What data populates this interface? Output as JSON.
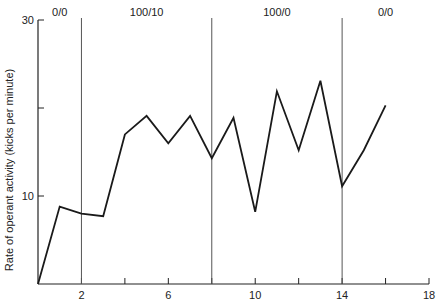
{
  "chart_data": {
    "type": "line",
    "title": "",
    "xlabel": "",
    "ylabel": "Rate of operant activity (kicks per minute)",
    "xlim": [
      0,
      18
    ],
    "ylim": [
      0,
      30
    ],
    "x_ticks": [
      2,
      4,
      6,
      8,
      10,
      12,
      14,
      16,
      18
    ],
    "x_tick_labels": [
      "2",
      "",
      "6",
      "",
      "10",
      "",
      "14",
      "",
      "18"
    ],
    "y_ticks": [
      10,
      20,
      30
    ],
    "y_tick_labels": [
      "10",
      "",
      "30"
    ],
    "grid": false,
    "legend": null,
    "phase_dividers": [
      2,
      8,
      14
    ],
    "phases": [
      {
        "label": "0/0",
        "start": 0,
        "end": 2
      },
      {
        "label": "100/10",
        "start": 2,
        "end": 8
      },
      {
        "label": "100/0",
        "start": 8,
        "end": 14
      },
      {
        "label": "0/0",
        "start": 14,
        "end": 18
      }
    ],
    "series": [
      {
        "name": "Operant activity",
        "x": [
          0,
          1,
          2,
          3,
          4,
          5,
          6,
          7,
          8,
          9,
          10,
          11,
          12,
          13,
          14,
          15,
          16
        ],
        "values": [
          0,
          8.8,
          8.0,
          7.7,
          17.0,
          19.1,
          16.0,
          19.1,
          14.3,
          18.9,
          8.2,
          21.9,
          15.2,
          23.1,
          11.1,
          15.2,
          20.3
        ]
      }
    ]
  },
  "colors": {
    "axis": "#222222",
    "line": "#1a1a1a",
    "divider": "#555555"
  }
}
